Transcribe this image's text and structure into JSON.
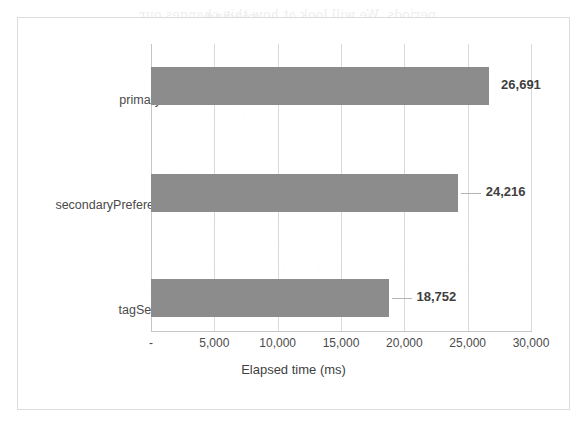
{
  "chart_data": {
    "type": "bar",
    "orientation": "horizontal",
    "title": "",
    "subtitle": "",
    "xlabel": "Elapsed time (ms)",
    "ylabel": "",
    "categories": [
      "primary",
      "secondaryPrefered",
      "tagSets"
    ],
    "values": [
      26691,
      24216,
      18752
    ],
    "data_labels": [
      "26,691",
      "24,216",
      "18,752"
    ],
    "xlim": [
      0,
      30000
    ],
    "xticks": [
      0,
      5000,
      10000,
      15000,
      20000,
      25000,
      30000
    ],
    "xtick_labels": [
      "-",
      "5,000",
      "10,000",
      "15,000",
      "20,000",
      "25,000",
      "30,000"
    ],
    "grid": "vertical",
    "legend": "none",
    "bar_color": "#8c8c8c",
    "gridline_color": "#d9d9d9",
    "plot_background": "#ffffff",
    "frame_border_color": "#dcdcdc"
  },
  "bleed_text": [
    {
      "x": 150,
      "y": 2,
      "text": "periods. We will look at how this changes our"
    },
    {
      "x": 330,
      "y": 4,
      "text": "reading"
    },
    {
      "x": 120,
      "y": 28,
      "text": "configurations you can use to read from a replica set, and"
    },
    {
      "x": 430,
      "y": 30,
      "text": "secondary"
    },
    {
      "x": 250,
      "y": 54,
      "text": "perform in the next chapter."
    },
    {
      "x": 430,
      "y": 56,
      "text": "us"
    },
    {
      "x": 340,
      "y": 104,
      "text": "the replication lag"
    },
    {
      "x": 60,
      "y": 154,
      "text": "as you can see in"
    },
    {
      "x": 400,
      "y": 152,
      "text": "figures"
    },
    {
      "x": 70,
      "y": 206,
      "text": "read preference has a significant impact on the latency"
    },
    {
      "x": 90,
      "y": 230,
      "text": "of our queries and the performance we get"
    },
    {
      "x": 110,
      "y": 256,
      "text": "is important to note that read preference is not the only"
    },
    {
      "x": 70,
      "y": 282,
      "text": "factor. The number of nodes in the replica set also matters"
    },
    {
      "x": 60,
      "y": 308,
      "text": "since we are now balancing our reads out of two nodes"
    },
    {
      "x": 90,
      "y": 332,
      "text": "instead of one, we cut our response time nearly in half"
    }
  ]
}
